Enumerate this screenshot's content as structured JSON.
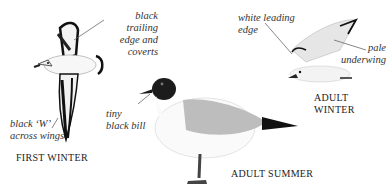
{
  "figure": {
    "birds": [
      {
        "id": "first-winter",
        "caption": "FIRST WINTER",
        "annotations": [
          {
            "lines": [
              "black trailing",
              "edge and",
              "coverts"
            ]
          },
          {
            "lines": [
              "black ‘W’",
              "across wings"
            ]
          }
        ]
      },
      {
        "id": "adult-summer",
        "caption": "ADULT SUMMER",
        "annotations": [
          {
            "lines": [
              "tiny",
              "black bill"
            ]
          }
        ]
      },
      {
        "id": "adult-winter",
        "caption_lines": [
          "ADULT",
          "WINTER"
        ],
        "annotations": [
          {
            "lines": [
              "white leading",
              "edge"
            ]
          },
          {
            "lines": [
              "pale",
              "underwing"
            ]
          }
        ]
      }
    ],
    "colors": {
      "background": "#ffffff",
      "ink": "#1a1a1a",
      "mantle_grey": "#b9b9b9",
      "leader_line": "#555555"
    }
  }
}
